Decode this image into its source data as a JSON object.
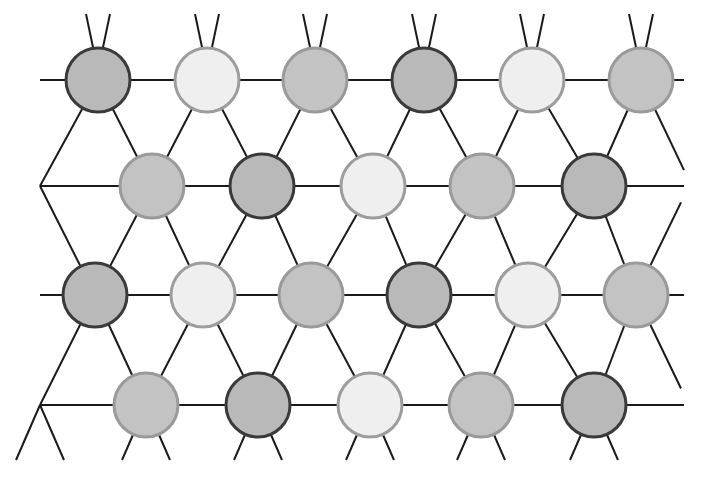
{
  "diagram": {
    "type": "triangular-lattice",
    "line_color": "#1a1a1a",
    "radius": 32,
    "palette": {
      "dark": {
        "fill": "#b9b9b9",
        "stroke": "#3a3a3a",
        "label": "dark-site"
      },
      "medium": {
        "fill": "#c3c3c3",
        "stroke": "#9a9a9a",
        "label": "medium-site"
      },
      "light": {
        "fill": "#efefef",
        "stroke": "#9d9d9d",
        "label": "light-site"
      }
    },
    "bounds": {
      "left": 40,
      "right": 684,
      "top": 14,
      "bottom": 460
    },
    "rows": [
      {
        "y": 80,
        "sites": [
          {
            "x": 98,
            "c": "dark"
          },
          {
            "x": 207,
            "c": "light"
          },
          {
            "x": 315,
            "c": "medium"
          },
          {
            "x": 424,
            "c": "dark"
          },
          {
            "x": 532,
            "c": "light"
          },
          {
            "x": 641,
            "c": "medium"
          }
        ]
      },
      {
        "y": 186,
        "sites": [
          {
            "x": 152,
            "c": "medium"
          },
          {
            "x": 262,
            "c": "dark"
          },
          {
            "x": 373,
            "c": "light"
          },
          {
            "x": 482,
            "c": "medium"
          },
          {
            "x": 594,
            "c": "dark"
          }
        ]
      },
      {
        "y": 295,
        "sites": [
          {
            "x": 95,
            "c": "dark"
          },
          {
            "x": 203,
            "c": "light"
          },
          {
            "x": 311,
            "c": "medium"
          },
          {
            "x": 419,
            "c": "dark"
          },
          {
            "x": 528,
            "c": "light"
          },
          {
            "x": 636,
            "c": "medium"
          }
        ]
      },
      {
        "y": 405,
        "sites": [
          {
            "x": 146,
            "c": "medium"
          },
          {
            "x": 258,
            "c": "dark"
          },
          {
            "x": 370,
            "c": "light"
          },
          {
            "x": 481,
            "c": "medium"
          },
          {
            "x": 594,
            "c": "dark"
          }
        ]
      }
    ]
  }
}
